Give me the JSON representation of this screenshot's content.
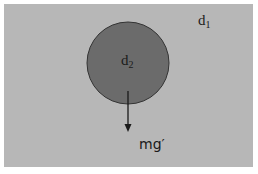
{
  "diagram": {
    "colors": {
      "background": "#ffffff",
      "fluid": "#b7b7b7",
      "sphere": "#6b6b6b",
      "sphere_outline": "#333333",
      "arrow": "#1a1a1a",
      "text": "#1a1a1a"
    },
    "fluid": {
      "label_base": "d",
      "label_sub": "1"
    },
    "sphere": {
      "label_base": "d",
      "label_sub": "2"
    },
    "force": {
      "label": "mg′",
      "direction": "down"
    }
  }
}
